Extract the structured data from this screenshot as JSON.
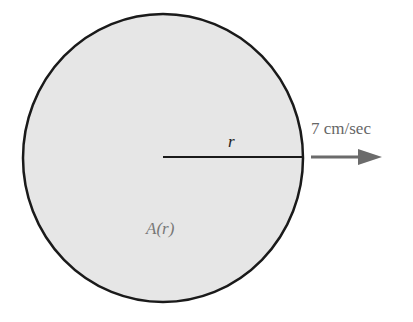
{
  "diagram": {
    "radius_label": "r",
    "velocity_label": "7 cm/sec",
    "area_label": "A(r)",
    "colors": {
      "circle_fill": "#e6e6e6",
      "circle_stroke": "#1a1a1a",
      "arrow": "#6b6b6b",
      "radius_line": "#1a1a1a"
    }
  }
}
